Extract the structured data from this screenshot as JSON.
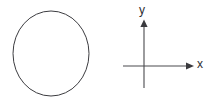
{
  "figure": {
    "background_color": "#ffffff",
    "width": 212,
    "height": 105
  },
  "circle": {
    "name": "circle-outline",
    "center_x": 51,
    "center_y": 53.5,
    "radius_x": 38,
    "radius_y": 42.5,
    "stroke_color": "#3c3c40",
    "stroke_width": 1,
    "fill": "none"
  },
  "axes": {
    "stroke_color": "#4a4a4e",
    "origin_x": 144,
    "origin_y": 66,
    "x_axis": {
      "name": "x-axis",
      "label": "x",
      "start_x": 123,
      "end_x": 194,
      "y": 66,
      "arrow": "right"
    },
    "y_axis": {
      "name": "y-axis",
      "label": "y",
      "x": 144,
      "start_y": 88,
      "end_y": 20,
      "arrow": "up"
    }
  },
  "labels": {
    "x_label": "x",
    "y_label": "y",
    "color": "#2e2e32",
    "font_size": 12
  }
}
